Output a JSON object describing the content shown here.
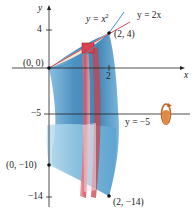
{
  "figure": {
    "type": "solid-of-revolution",
    "axis_of_rotation": "y = -5",
    "curves": [
      {
        "label": "y = x²",
        "color": "#3a9ad0"
      },
      {
        "label": "y = 2x",
        "color": "#d94a5a"
      }
    ]
  },
  "axes": {
    "x_label": "x",
    "y_label": "y",
    "x_ticks": [
      "2"
    ],
    "y_ticks": [
      "4",
      "−5",
      "−14"
    ]
  },
  "labels": {
    "curve_parabola": "y = x",
    "curve_parabola_exp": "2",
    "curve_line": "y = 2x",
    "axis_rotation": "y = −5",
    "point_origin": "(0, 0)",
    "point_top": "(2, 4)",
    "point_left_bottom": "(0, −10)",
    "point_right_bottom": "(2, −14)"
  },
  "colors": {
    "solid_blue": "#3f8fc0",
    "solid_blue_light": "#a9d3ea",
    "washer_red": "#d9606e",
    "washer_pink": "#f1c3c8",
    "rotation_icon": "#d97a35",
    "axis": "#222222"
  }
}
